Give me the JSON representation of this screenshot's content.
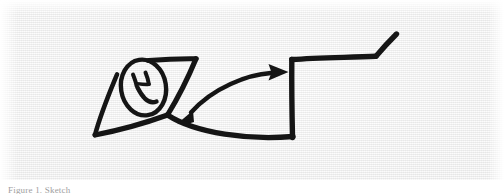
{
  "figure": {
    "medium": "hand-drawn ink sketch on paper (scanned)",
    "caption": "Figure 1.  Sketch",
    "background_color": "#f4f4f4",
    "ink_color": "#151515",
    "canvas": {
      "width": 504,
      "height": 194
    }
  },
  "scene": {
    "title": "Smiley face on a wedge with a double-headed arrow pointing to a step",
    "elements": [
      {
        "name": "wedge-shape",
        "label": "Triangular wedge / ramp on the left",
        "description": "Open triangle: a long top edge running right, a diagonal falling to a left point, and a lower edge rising back to the crossing node."
      },
      {
        "name": "smiley-face",
        "label": "Smiley face",
        "description": "Tall oval head with two short curved eyes and a wide curved smile, drawn overlapping the wedge.",
        "features": [
          "oval-head",
          "left-eye",
          "right-eye",
          "smile"
        ]
      },
      {
        "name": "double-arrow",
        "label": "Double-headed curved arrow",
        "description": "A shallow arc spanning from the wedge node up to the step riser, with a solid filled arrowhead at each end.",
        "arrowheads": 2,
        "direction": "bidirectional"
      },
      {
        "name": "step-shape",
        "label": "Step / bench profile on the right",
        "description": "A tall vertical riser rising from the sagging base curve, a long horizontal tread running right, then a short diagonal kicking up to the top-right."
      },
      {
        "name": "base-curve",
        "label": "Sagging base curve",
        "description": "A long downward-bowing line joining the wedge node to the foot of the step riser."
      }
    ]
  }
}
